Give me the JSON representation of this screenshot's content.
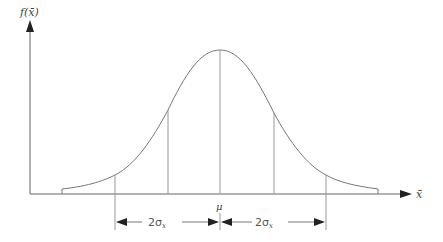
{
  "diagram": {
    "y_axis_label": "f(x̄)",
    "x_axis_label": "x̄",
    "center_label": "μ",
    "left_span_label": "2σ",
    "left_span_sub": "x",
    "right_span_label": "2σ",
    "right_span_sub": "x",
    "colors": {
      "axis": "#555555",
      "curve": "#777777",
      "lines": "#999999",
      "text": "#444444"
    }
  }
}
